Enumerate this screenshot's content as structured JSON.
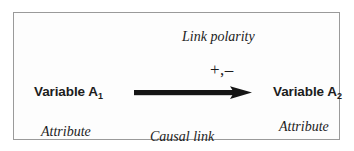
{
  "diagram": {
    "frame": {
      "border_color": "#9a9a9a",
      "background_color": "#fdfdfd"
    },
    "nodes": [
      {
        "id": "variable-a1",
        "text_main": "Variable A",
        "text_sub": "1"
      },
      {
        "id": "variable-a2",
        "text_main": "Variable A",
        "text_sub": "2"
      }
    ],
    "annotations": {
      "link_polarity": "Link polarity",
      "polarity_sign": "+,–",
      "causal_link": "Causal link",
      "attribute_left": "Attribute",
      "attribute_right": "Attribute"
    },
    "arrow": {
      "name": "causal-link-arrow",
      "direction": "left-to-right",
      "color": "#151515"
    }
  }
}
